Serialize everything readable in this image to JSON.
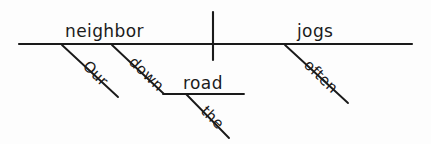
{
  "diagram": {
    "type": "reed-kellogg-sentence-diagram",
    "sentence": "Our neighbor jogs down the road often.",
    "stroke_color": "#1a1a1a",
    "background_color": "#fdfdfd",
    "baseline": {
      "name": "main-baseline",
      "x1": 19,
      "y1": 44,
      "x2": 412,
      "y2": 44
    },
    "divider": {
      "name": "subject-predicate-divider",
      "x": 213,
      "y1": 12,
      "y2": 60
    },
    "words": {
      "subject": "neighbor",
      "verb": "jogs",
      "subject_modifier": "Our",
      "preposition": "down",
      "object_of_preposition": "road",
      "article": "the",
      "adverb": "often"
    },
    "slots": [
      {
        "name": "subject",
        "label": "neighbor",
        "role": "subject",
        "x": 65,
        "y": 37,
        "rotation": 0,
        "size": "large"
      },
      {
        "name": "verb",
        "label": "jogs",
        "role": "verb",
        "x": 297,
        "y": 37,
        "rotation": 0,
        "size": "large"
      },
      {
        "name": "subject-modifier",
        "label": "Our",
        "role": "possessive-adjective",
        "x": 82,
        "y": 67,
        "rotation": 45,
        "size": "small"
      },
      {
        "name": "preposition",
        "label": "down",
        "role": "preposition",
        "x": 128,
        "y": 63,
        "rotation": 44,
        "size": "small"
      },
      {
        "name": "object-of-preposition",
        "label": "road",
        "role": "object-of-preposition",
        "x": 183,
        "y": 89,
        "rotation": 0,
        "size": "large"
      },
      {
        "name": "article",
        "label": "the",
        "role": "article",
        "x": 200,
        "y": 112,
        "rotation": 45,
        "size": "small"
      },
      {
        "name": "adverb",
        "label": "often",
        "role": "adverb",
        "x": 303,
        "y": 66,
        "rotation": 44,
        "size": "small"
      }
    ],
    "diagonals": [
      {
        "name": "our-modifier-line",
        "x1": 62,
        "y1": 45,
        "x2": 118,
        "y2": 97
      },
      {
        "name": "down-preposition-line",
        "x1": 112,
        "y1": 45,
        "x2": 164,
        "y2": 94
      },
      {
        "name": "the-article-line",
        "x1": 186,
        "y1": 94,
        "x2": 229,
        "y2": 138
      },
      {
        "name": "often-adverb-line",
        "x1": 285,
        "y1": 45,
        "x2": 348,
        "y2": 103
      }
    ],
    "sublines": [
      {
        "name": "prepositional-object-line",
        "x1": 163,
        "y1": 94,
        "x2": 244,
        "y2": 94
      }
    ]
  }
}
